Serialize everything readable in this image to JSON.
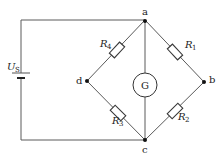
{
  "diagram": {
    "type": "wheatstone-bridge",
    "source": {
      "symbol": "U",
      "subscript": "S"
    },
    "nodes": [
      {
        "id": "a",
        "label": "a"
      },
      {
        "id": "b",
        "label": "b"
      },
      {
        "id": "c",
        "label": "c"
      },
      {
        "id": "d",
        "label": "d"
      }
    ],
    "resistors": [
      {
        "id": "R1",
        "symbol": "R",
        "subscript": "1",
        "between": [
          "a",
          "b"
        ]
      },
      {
        "id": "R2",
        "symbol": "R",
        "subscript": "2",
        "between": [
          "b",
          "c"
        ]
      },
      {
        "id": "R3",
        "symbol": "R",
        "subscript": "3",
        "between": [
          "d",
          "c"
        ]
      },
      {
        "id": "R4",
        "symbol": "R",
        "subscript": "4",
        "between": [
          "a",
          "d"
        ]
      }
    ],
    "galvanometer": {
      "label": "G",
      "between": [
        "a",
        "c"
      ]
    }
  }
}
